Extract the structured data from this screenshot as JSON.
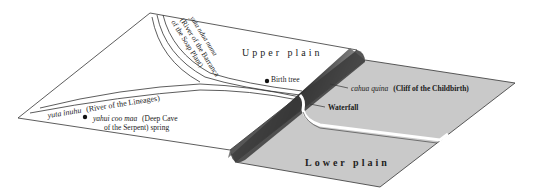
{
  "diagram": {
    "regions": {
      "upper_plain": "Upper plain",
      "lower_plain": "Lower plain"
    },
    "labels": {
      "barranca_river_native": "yuta ndua numa",
      "barranca_river_line1": "(River of the Barranca",
      "barranca_river_line2": "of the Soap Plant)",
      "lineages_river_native": "yuta inuhu",
      "lineages_river_english": "(River of the Lineages)",
      "spring_native": "yahui coo maa",
      "spring_english_line1": "(Deep Cave",
      "spring_english_line2": "of the Serpent) spring",
      "birth_tree": "Birth tree",
      "cliff_native": "cahua quina",
      "cliff_english": "(Cliff of the Childbirth)",
      "waterfall": "Waterfall"
    },
    "colors": {
      "upper_plain": "#ffffff",
      "lower_plain": "#c9c9c9",
      "cliff_shadow": "#3a3a3a",
      "outline": "#333333"
    }
  }
}
